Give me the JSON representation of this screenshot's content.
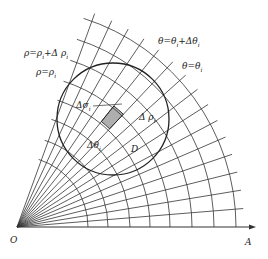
{
  "diagram": {
    "origin": {
      "label": "O",
      "x": 17,
      "y": 227
    },
    "axis": {
      "label": "A",
      "end_x": 256
    },
    "rays": {
      "count": 16,
      "max_angle_deg": 70
    },
    "arcs": {
      "radii": [
        71,
        91,
        113,
        133,
        153,
        175,
        197,
        219
      ]
    },
    "region": {
      "label": "D",
      "cx": 113,
      "cy": 119,
      "r": 56
    },
    "cell": {
      "label": "Δσ_i"
    },
    "colors": {
      "line": "#333333",
      "bg": "#ffffff"
    }
  },
  "labels": {
    "rho_plus": {
      "main": "ρ=ρ",
      "sub1": "i",
      "mid": "+Δ ρ",
      "sub2": "i"
    },
    "rho": {
      "main": "ρ=ρ",
      "sub1": "i"
    },
    "theta_plus": {
      "main": "θ=θ",
      "sub1": "i",
      "mid": "+Δθ",
      "sub2": "i"
    },
    "theta": {
      "main": "θ=θ",
      "sub1": "i"
    },
    "delta_sigma": {
      "main": "Δσ",
      "sub1": "i"
    },
    "delta_rho": {
      "main": "Δ ρ",
      "sub1": "i"
    },
    "delta_theta": {
      "main": "Δθ",
      "sub1": "i"
    },
    "region": "D",
    "origin": "O",
    "axis": "A"
  }
}
